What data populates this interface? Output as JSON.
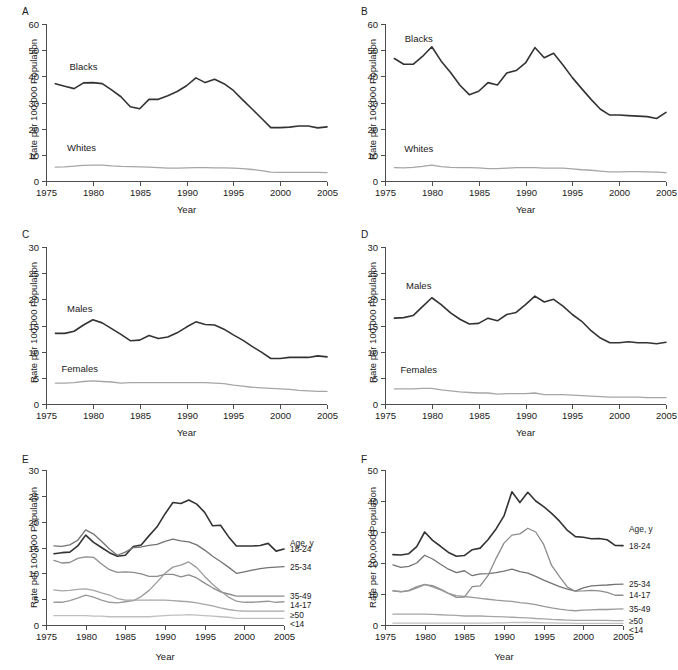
{
  "figure": {
    "axis_label_y": "Rate per 100,000 Population",
    "axis_label_x": "Year",
    "legend_title": "Age, y",
    "colors": {
      "dark": "#333333",
      "mid_dark": "#595959",
      "mid": "#737373",
      "mid_light": "#8c8c8c",
      "light": "#a6a6a6",
      "lighter": "#bfbfbf",
      "axis": "#4d4d4d"
    },
    "panels": [
      {
        "letter": "A",
        "label_x": 0,
        "label_y": 0
      },
      {
        "letter": "B",
        "label_x": 339,
        "label_y": 0
      },
      {
        "letter": "C",
        "label_x": 0,
        "label_y": 223
      },
      {
        "letter": "D",
        "label_x": 339,
        "label_y": 223
      },
      {
        "letter": "E",
        "label_x": 0,
        "label_y": 448
      },
      {
        "letter": "F",
        "label_x": 339,
        "label_y": 448
      }
    ]
  },
  "chart_data": [
    {
      "panel": "A",
      "type": "line",
      "title": "A",
      "xlabel": "Year",
      "ylabel": "Rate per 100,000 Population",
      "xlim": [
        1975,
        2005
      ],
      "ylim": [
        0,
        60
      ],
      "yticks": [
        0,
        10,
        20,
        30,
        40,
        50,
        60
      ],
      "xticks": [
        1975,
        1980,
        1985,
        1990,
        1995,
        2000,
        2005
      ],
      "grid": false,
      "legend": "inline-labels",
      "x": [
        1976,
        1977,
        1978,
        1979,
        1980,
        1981,
        1982,
        1983,
        1984,
        1985,
        1986,
        1987,
        1988,
        1989,
        1990,
        1991,
        1992,
        1993,
        1994,
        1995,
        1996,
        1997,
        1998,
        1999,
        2000,
        2001,
        2002,
        2003,
        2004,
        2005
      ],
      "series": [
        {
          "name": "Blacks",
          "color": "#333333",
          "values": [
            37.2,
            36.2,
            35.3,
            37.5,
            37.6,
            37.2,
            34.8,
            32.2,
            28.4,
            27.6,
            31.2,
            31.2,
            32.6,
            34.2,
            36.4,
            39.4,
            37.6,
            38.9,
            37.2,
            34.6,
            31.0,
            27.5,
            24.0,
            20.4,
            20.4,
            20.6,
            21.0,
            21.0,
            20.3,
            20.7
          ]
        },
        {
          "name": "Whites",
          "color": "#a6a6a6",
          "values": [
            5.3,
            5.4,
            5.7,
            6.0,
            6.1,
            6.1,
            5.8,
            5.6,
            5.5,
            5.4,
            5.3,
            5.1,
            4.9,
            4.9,
            5.0,
            5.1,
            5.1,
            5.0,
            5.0,
            4.9,
            4.7,
            4.4,
            4.0,
            3.4,
            3.3,
            3.3,
            3.3,
            3.3,
            3.3,
            3.2
          ]
        }
      ]
    },
    {
      "panel": "B",
      "type": "line",
      "title": "B",
      "xlabel": "Year",
      "ylabel": "Rate per 100,000 Population",
      "xlim": [
        1975,
        2005
      ],
      "ylim": [
        0,
        60
      ],
      "yticks": [
        0,
        10,
        20,
        30,
        40,
        50,
        60
      ],
      "xticks": [
        1975,
        1980,
        1985,
        1990,
        1995,
        2000,
        2005
      ],
      "grid": false,
      "legend": "inline-labels",
      "x": [
        1976,
        1977,
        1978,
        1979,
        1980,
        1981,
        1982,
        1983,
        1984,
        1985,
        1986,
        1987,
        1988,
        1989,
        1990,
        1991,
        1992,
        1993,
        1994,
        1995,
        1996,
        1997,
        1998,
        1999,
        2000,
        2001,
        2002,
        2003,
        2004,
        2005
      ],
      "series": [
        {
          "name": "Blacks",
          "color": "#333333",
          "values": [
            46.8,
            44.6,
            44.6,
            47.6,
            51.3,
            45.8,
            41.5,
            36.6,
            33.0,
            34.3,
            37.6,
            36.7,
            41.3,
            42.2,
            45.1,
            51.0,
            47.1,
            48.8,
            44.3,
            39.5,
            35.3,
            31.2,
            27.4,
            25.2,
            25.2,
            25.0,
            24.8,
            24.6,
            23.9,
            26.2
          ]
        },
        {
          "name": "Whites",
          "color": "#a6a6a6",
          "values": [
            5.1,
            5.0,
            5.2,
            5.6,
            6.1,
            5.5,
            5.2,
            5.1,
            5.1,
            5.0,
            4.7,
            4.7,
            4.9,
            5.1,
            5.1,
            5.1,
            4.9,
            4.9,
            4.9,
            4.6,
            4.3,
            4.1,
            3.8,
            3.5,
            3.5,
            3.6,
            3.6,
            3.5,
            3.4,
            3.2
          ]
        }
      ]
    },
    {
      "panel": "C",
      "type": "line",
      "title": "C",
      "xlabel": "Year",
      "ylabel": "Rate per 100,000 Population",
      "xlim": [
        1975,
        2005
      ],
      "ylim": [
        0,
        30
      ],
      "yticks": [
        0,
        5,
        10,
        15,
        20,
        25,
        30
      ],
      "xticks": [
        1975,
        1980,
        1985,
        1990,
        1995,
        2000,
        2005
      ],
      "grid": false,
      "legend": "inline-labels",
      "x": [
        1976,
        1977,
        1978,
        1979,
        1980,
        1981,
        1982,
        1983,
        1984,
        1985,
        1986,
        1987,
        1988,
        1989,
        1990,
        1991,
        1992,
        1993,
        1994,
        1995,
        1996,
        1997,
        1998,
        1999,
        2000,
        2001,
        2002,
        2003,
        2004,
        2005
      ],
      "series": [
        {
          "name": "Males",
          "color": "#333333",
          "values": [
            13.5,
            13.5,
            13.9,
            15.1,
            16.1,
            15.5,
            14.4,
            13.3,
            12.1,
            12.2,
            13.1,
            12.5,
            12.8,
            13.6,
            14.7,
            15.7,
            15.2,
            15.1,
            14.3,
            13.2,
            12.2,
            11.0,
            9.9,
            8.7,
            8.7,
            8.9,
            8.9,
            8.9,
            9.2,
            9.0
          ]
        },
        {
          "name": "Females",
          "color": "#a6a6a6",
          "values": [
            4.0,
            4.0,
            4.1,
            4.3,
            4.4,
            4.3,
            4.2,
            4.0,
            4.1,
            4.1,
            4.1,
            4.1,
            4.1,
            4.1,
            4.1,
            4.1,
            4.1,
            4.0,
            3.9,
            3.6,
            3.4,
            3.2,
            3.1,
            3.0,
            2.9,
            2.8,
            2.6,
            2.5,
            2.4,
            2.4
          ]
        }
      ]
    },
    {
      "panel": "D",
      "type": "line",
      "title": "D",
      "xlabel": "Year",
      "ylabel": "Rate per 100,000 Population",
      "xlim": [
        1975,
        2005
      ],
      "ylim": [
        0,
        30
      ],
      "yticks": [
        0,
        5,
        10,
        15,
        20,
        25,
        30
      ],
      "xticks": [
        1975,
        1980,
        1985,
        1990,
        1995,
        2000,
        2005
      ],
      "grid": false,
      "legend": "inline-labels",
      "x": [
        1976,
        1977,
        1978,
        1979,
        1980,
        1981,
        1982,
        1983,
        1984,
        1985,
        1986,
        1987,
        1988,
        1989,
        1990,
        1991,
        1992,
        1993,
        1994,
        1995,
        1996,
        1997,
        1998,
        1999,
        2000,
        2001,
        2002,
        2003,
        2004,
        2005
      ],
      "series": [
        {
          "name": "Males",
          "color": "#333333",
          "values": [
            16.4,
            16.5,
            16.9,
            18.6,
            20.3,
            19.0,
            17.4,
            16.2,
            15.3,
            15.4,
            16.4,
            15.9,
            17.1,
            17.5,
            19.0,
            20.6,
            19.5,
            20.0,
            18.7,
            17.1,
            15.8,
            14.0,
            12.6,
            11.7,
            11.7,
            11.9,
            11.7,
            11.7,
            11.5,
            11.8
          ]
        },
        {
          "name": "Females",
          "color": "#a6a6a6",
          "values": [
            2.9,
            2.9,
            2.9,
            3.0,
            3.0,
            2.7,
            2.5,
            2.3,
            2.2,
            2.1,
            2.1,
            1.9,
            2.0,
            2.0,
            2.0,
            2.1,
            1.8,
            1.8,
            1.8,
            1.7,
            1.6,
            1.5,
            1.4,
            1.3,
            1.3,
            1.3,
            1.3,
            1.2,
            1.2,
            1.2
          ]
        }
      ]
    },
    {
      "panel": "E",
      "type": "line",
      "title": "E",
      "xlabel": "Year",
      "ylabel": "Rate per 100,000 Population",
      "legend_title": "Age, y",
      "xlim": [
        1975,
        2005
      ],
      "ylim": [
        0,
        30
      ],
      "yticks": [
        0,
        5,
        10,
        15,
        20,
        25,
        30
      ],
      "xticks": [
        1975,
        1980,
        1985,
        1990,
        1995,
        2000,
        2005
      ],
      "grid": false,
      "legend": "right-of-axis",
      "x": [
        1976,
        1977,
        1978,
        1979,
        1980,
        1981,
        1982,
        1983,
        1984,
        1985,
        1986,
        1987,
        1988,
        1989,
        1990,
        1991,
        1992,
        1993,
        1994,
        1995,
        1996,
        1997,
        1998,
        1999,
        2000,
        2001,
        2002,
        2003,
        2004,
        2005
      ],
      "series": [
        {
          "name": "18-24",
          "color": "#333333",
          "values": [
            13.8,
            14.0,
            14.1,
            15.3,
            17.4,
            16.0,
            15.0,
            14.0,
            13.3,
            13.5,
            15.2,
            15.5,
            17.3,
            19.0,
            21.5,
            23.7,
            23.5,
            24.2,
            23.4,
            21.8,
            19.2,
            19.3,
            17.1,
            15.3,
            15.3,
            15.3,
            15.4,
            15.8,
            14.3,
            14.7
          ]
        },
        {
          "name": "25-34",
          "color": "#737373",
          "values": [
            15.3,
            15.2,
            15.5,
            16.4,
            18.4,
            17.6,
            16.2,
            14.7,
            13.5,
            14.1,
            15.0,
            15.1,
            15.4,
            15.6,
            16.2,
            16.6,
            16.3,
            16.1,
            15.5,
            14.5,
            13.3,
            12.3,
            11.2,
            10.0,
            10.3,
            10.6,
            10.9,
            11.1,
            11.2,
            11.3
          ]
        },
        {
          "name": "35-49",
          "color": "#8c8c8c",
          "values": [
            12.5,
            12.0,
            12.1,
            12.9,
            13.2,
            13.1,
            11.8,
            10.7,
            10.2,
            10.3,
            10.2,
            9.9,
            9.4,
            9.4,
            9.8,
            9.8,
            9.3,
            9.7,
            9.1,
            8.1,
            7.2,
            6.4,
            6.0,
            5.6,
            5.6,
            5.6,
            5.6,
            5.6,
            5.6,
            5.6
          ]
        },
        {
          "name": "14-17",
          "color": "#999999",
          "values": [
            4.4,
            4.4,
            4.7,
            5.2,
            5.8,
            5.4,
            4.8,
            4.4,
            4.3,
            4.5,
            4.7,
            5.5,
            6.7,
            8.3,
            10.0,
            11.2,
            11.6,
            12.2,
            11.1,
            9.4,
            7.9,
            6.6,
            5.4,
            4.6,
            4.4,
            4.4,
            4.5,
            4.6,
            4.4,
            4.5
          ]
        },
        {
          "name": "≥50",
          "color": "#a6a6a6",
          "values": [
            6.8,
            6.6,
            6.7,
            6.9,
            7.0,
            6.7,
            6.2,
            5.8,
            5.1,
            4.8,
            4.8,
            4.8,
            4.8,
            4.8,
            4.8,
            4.7,
            4.6,
            4.5,
            4.3,
            4.0,
            3.7,
            3.3,
            3.0,
            2.8,
            2.7,
            2.7,
            2.7,
            2.7,
            2.7,
            2.7
          ]
        },
        {
          "name": "<14",
          "color": "#bfbfbf",
          "values": [
            1.8,
            1.8,
            1.8,
            1.8,
            1.8,
            1.7,
            1.7,
            1.6,
            1.6,
            1.6,
            1.6,
            1.6,
            1.6,
            1.7,
            1.8,
            1.9,
            1.9,
            2.0,
            1.9,
            1.8,
            1.7,
            1.6,
            1.5,
            1.3,
            1.3,
            1.3,
            1.3,
            1.3,
            1.3,
            1.3
          ]
        }
      ]
    },
    {
      "panel": "F",
      "type": "line",
      "title": "F",
      "xlabel": "Year",
      "ylabel": "Rate per 100,000 Population",
      "legend_title": "Age, y",
      "xlim": [
        1975,
        2005
      ],
      "ylim": [
        0,
        50
      ],
      "yticks": [
        0,
        10,
        20,
        30,
        40,
        50
      ],
      "xticks": [
        1975,
        1980,
        1985,
        1990,
        1995,
        2000,
        2005
      ],
      "grid": false,
      "legend": "right-of-axis",
      "x": [
        1976,
        1977,
        1978,
        1979,
        1980,
        1981,
        1982,
        1983,
        1984,
        1985,
        1986,
        1987,
        1988,
        1989,
        1990,
        1991,
        1992,
        1993,
        1994,
        1995,
        1996,
        1997,
        1998,
        1999,
        2000,
        2001,
        2002,
        2003,
        2004,
        2005
      ],
      "series": [
        {
          "name": "18-24",
          "color": "#333333",
          "values": [
            22.7,
            22.6,
            23.0,
            25.3,
            30.0,
            27.3,
            25.4,
            23.4,
            22.2,
            22.4,
            24.3,
            24.8,
            27.6,
            31.0,
            35.2,
            43.0,
            39.5,
            42.8,
            40.0,
            38.2,
            36.0,
            33.5,
            30.5,
            28.5,
            28.3,
            27.8,
            27.9,
            27.5,
            25.7,
            25.6
          ]
        },
        {
          "name": "25-34",
          "color": "#737373",
          "values": [
            19.4,
            18.6,
            18.9,
            20.0,
            22.5,
            21.3,
            19.6,
            18.0,
            16.9,
            17.5,
            15.9,
            16.5,
            16.6,
            16.9,
            17.4,
            18.0,
            17.2,
            16.7,
            15.7,
            14.5,
            13.4,
            12.4,
            11.6,
            10.9,
            12.0,
            12.6,
            12.8,
            12.9,
            13.1,
            13.2
          ]
        },
        {
          "name": "14-17",
          "color": "#8c8c8c",
          "values": [
            11.0,
            10.7,
            11.0,
            12.0,
            13.0,
            12.7,
            11.6,
            10.2,
            8.9,
            9.0,
            12.4,
            12.6,
            16.0,
            21.5,
            26.4,
            29.0,
            29.4,
            31.2,
            30.0,
            26.0,
            19.2,
            15.6,
            12.2,
            10.9,
            11.0,
            11.2,
            11.0,
            10.5,
            9.6,
            9.6
          ]
        },
        {
          "name": "35-49",
          "color": "#999999",
          "values": [
            11.1,
            10.8,
            11.2,
            12.4,
            13.1,
            12.3,
            11.3,
            10.2,
            9.5,
            9.2,
            8.9,
            8.6,
            8.3,
            8.0,
            7.8,
            7.6,
            7.2,
            7.0,
            6.6,
            6.0,
            5.5,
            5.1,
            4.8,
            4.6,
            4.8,
            4.9,
            5.0,
            5.0,
            5.1,
            5.2
          ]
        },
        {
          "name": "≥50",
          "color": "#a6a6a6",
          "values": [
            3.5,
            3.5,
            3.5,
            3.5,
            3.5,
            3.4,
            3.3,
            3.2,
            3.1,
            2.9,
            2.9,
            2.9,
            2.8,
            2.7,
            2.6,
            2.5,
            2.4,
            2.3,
            2.1,
            2.0,
            1.8,
            1.7,
            1.6,
            1.5,
            1.5,
            1.5,
            1.5,
            1.5,
            1.4,
            1.4
          ]
        },
        {
          "name": "<14",
          "color": "#bfbfbf",
          "values": [
            0.6,
            0.6,
            0.6,
            0.6,
            0.6,
            0.6,
            0.6,
            0.6,
            0.6,
            0.6,
            0.6,
            0.6,
            0.6,
            0.7,
            0.7,
            0.8,
            0.8,
            0.8,
            0.8,
            0.7,
            0.7,
            0.6,
            0.6,
            0.5,
            0.5,
            0.5,
            0.5,
            0.5,
            0.5,
            0.5
          ]
        }
      ]
    }
  ]
}
